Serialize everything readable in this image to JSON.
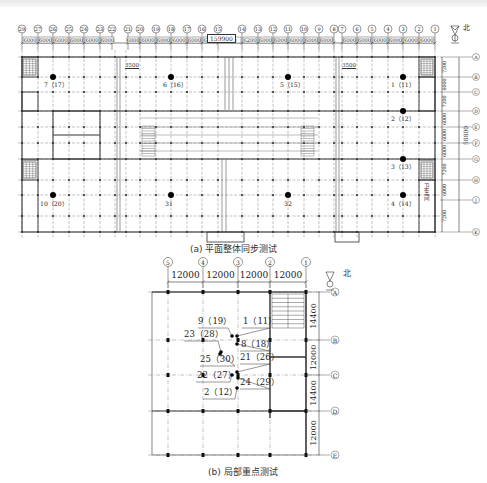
{
  "header_strip": {
    "text": ""
  },
  "plan_a": {
    "caption": "(a) 平面整体同步测试",
    "north_label": "北",
    "total_width_dim": "159900",
    "total_height_dim": "58800",
    "offset_dims": [
      "3500",
      "3500"
    ],
    "column_axes": [
      "29",
      "27",
      "26",
      "25",
      "24",
      "23",
      "22",
      "21",
      "20",
      "19",
      "18",
      "17",
      "16",
      "15",
      "14",
      "13",
      "12",
      "11",
      "10",
      "9",
      "8",
      "7",
      "6",
      "5",
      "4",
      "3",
      "2",
      "1"
    ],
    "column_spacings": [
      "6000",
      "6000",
      "6000",
      "6000",
      "6000",
      "6000",
      "6000",
      "6000",
      "6000",
      "6000",
      "6000",
      "6200",
      "8500",
      "6200",
      "6000",
      "6000",
      "6000",
      "6000",
      "6000",
      "6000",
      "6000",
      "6000",
      "6000",
      "6000",
      "6000",
      "6000"
    ],
    "row_axes": [
      "A",
      "B",
      "C",
      "D",
      "E",
      "F",
      "G",
      "H",
      "J",
      "K"
    ],
    "row_spacings": [
      "7200",
      "6000",
      "7200",
      "6000",
      "6000",
      "6000",
      "7200",
      "6000",
      "7200"
    ],
    "room_label": "卫生间",
    "points": [
      {
        "label": "7（17）"
      },
      {
        "label": "6（16）"
      },
      {
        "label": "5（15）"
      },
      {
        "label": "1（11）"
      },
      {
        "label": "2（12）"
      },
      {
        "label": "3（13）"
      },
      {
        "label": "10（20）"
      },
      {
        "label": "31"
      },
      {
        "label": "32"
      },
      {
        "label": "4（14）"
      }
    ]
  },
  "plan_b": {
    "caption": "(b) 局部重点测试",
    "north_label": "北",
    "column_axes": [
      "5",
      "4",
      "3",
      "2",
      "1"
    ],
    "column_spacings": [
      "12000",
      "12000",
      "12000",
      "12000"
    ],
    "row_axes": [
      "A",
      "B",
      "C",
      "D",
      "E"
    ],
    "row_spacings": [
      "14400",
      "12000",
      "14400",
      "12000"
    ],
    "points": [
      {
        "label": "9（19）"
      },
      {
        "label": "1（11）"
      },
      {
        "label": "23（28）"
      },
      {
        "label": "8（18）"
      },
      {
        "label": "25（30）"
      },
      {
        "label": "21（26）"
      },
      {
        "label": "22（27）"
      },
      {
        "label": "24（29）"
      },
      {
        "label": "2（12）"
      }
    ]
  }
}
